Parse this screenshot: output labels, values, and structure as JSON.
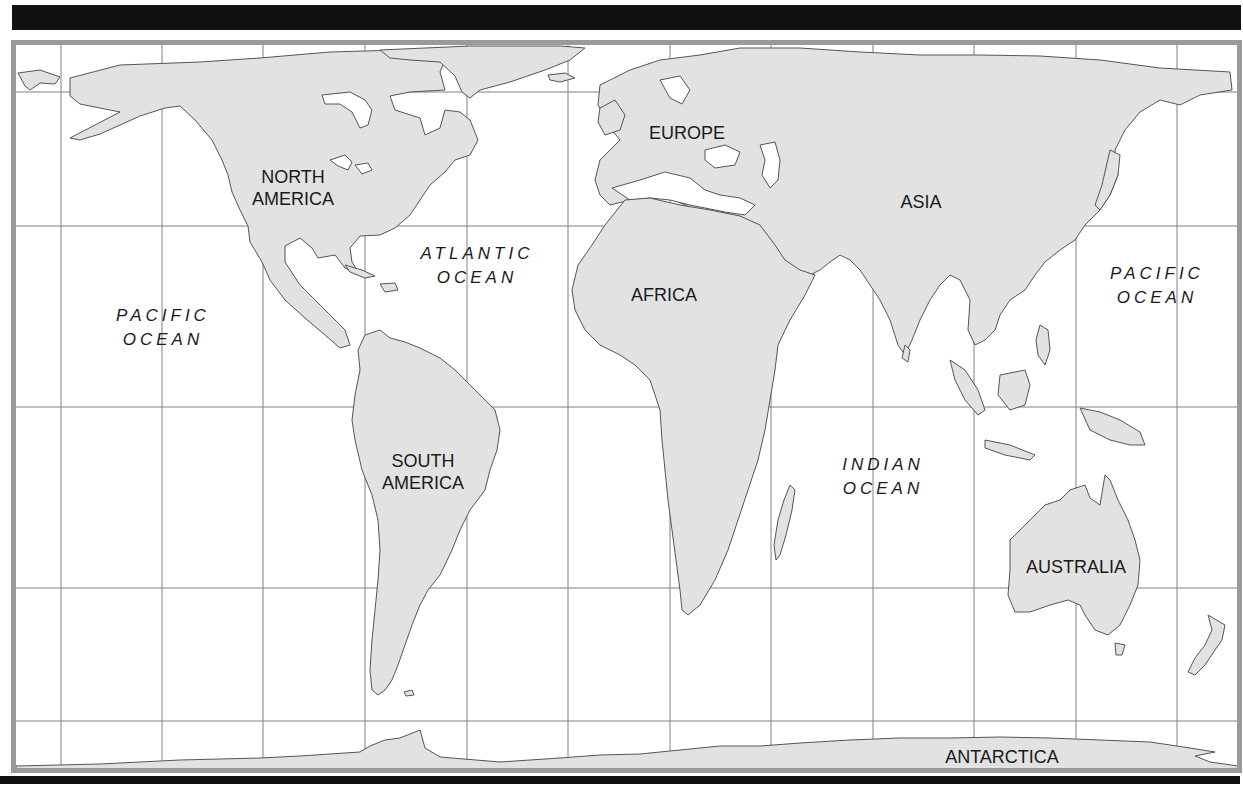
{
  "map": {
    "title": "World Map",
    "colors": {
      "land": "#e2e2e2",
      "coast": "#555555",
      "grid": "#808080",
      "frame": "#9a9a9a",
      "bars": "#111111",
      "text": "#1a1a1a"
    },
    "grid": {
      "meridians_x": [
        61,
        162,
        263,
        365,
        467,
        568,
        670,
        771,
        873,
        974,
        1076,
        1177
      ],
      "parallels_y": [
        92,
        226,
        407,
        588,
        721
      ]
    },
    "continents": [
      {
        "id": "north-america",
        "lines": [
          "NORTH",
          "AMERICA"
        ],
        "x": 293,
        "y": 166
      },
      {
        "id": "south-america",
        "lines": [
          "SOUTH",
          "AMERICA"
        ],
        "x": 423,
        "y": 450
      },
      {
        "id": "europe",
        "lines": [
          "EUROPE"
        ],
        "x": 687,
        "y": 122
      },
      {
        "id": "africa",
        "lines": [
          "AFRICA"
        ],
        "x": 664,
        "y": 284
      },
      {
        "id": "asia",
        "lines": [
          "ASIA"
        ],
        "x": 921,
        "y": 191
      },
      {
        "id": "australia",
        "lines": [
          "AUSTRALIA"
        ],
        "x": 1076,
        "y": 556
      },
      {
        "id": "antarctica",
        "lines": [
          "ANTARCTICA"
        ],
        "x": 1002,
        "y": 746
      }
    ],
    "oceans": [
      {
        "id": "pacific-west",
        "lines": [
          "PACIFIC",
          "OCEAN"
        ],
        "x": 163,
        "y": 304
      },
      {
        "id": "atlantic",
        "lines": [
          "ATLANTIC",
          "OCEAN"
        ],
        "x": 477,
        "y": 242
      },
      {
        "id": "indian",
        "lines": [
          "INDIAN",
          "OCEAN"
        ],
        "x": 883,
        "y": 453
      },
      {
        "id": "pacific-east",
        "lines": [
          "PACIFIC",
          "OCEAN"
        ],
        "x": 1157,
        "y": 262
      }
    ]
  }
}
